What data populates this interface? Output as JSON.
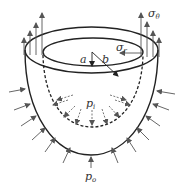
{
  "diagram": {
    "colors": {
      "stroke": "#222222",
      "arrow": "#555555",
      "background": "#ffffff"
    },
    "labels": {
      "a": {
        "text": "a",
        "sub": ""
      },
      "b": {
        "text": "b",
        "sub": ""
      },
      "sigma_r": {
        "text": "σ",
        "sub": "r"
      },
      "sigma_theta": {
        "text": "σ",
        "sub": "θ"
      },
      "p_i": {
        "text": "p",
        "sub": "i"
      },
      "p_o": {
        "text": "p",
        "sub": "o"
      }
    },
    "elements": [
      {
        "name": "outer-rim-ellipse",
        "description": "outer top boundary, radius b"
      },
      {
        "name": "inner-rim-ellipse",
        "description": "inner top boundary, radius a"
      },
      {
        "name": "outer-shell-surface",
        "description": "solid outer hemispherical surface"
      },
      {
        "name": "inner-shell-surface",
        "description": "dashed inner hemispherical surface"
      },
      {
        "name": "hoop-stress-arrows",
        "description": "vertical upward arrows σθ at rim, left and right"
      },
      {
        "name": "external-pressure-arrows",
        "description": "inward-pointing arrows p_o around outer surface"
      },
      {
        "name": "internal-pressure-arrows",
        "description": "dashed outward-pointing arrows p_i on inner surface"
      },
      {
        "name": "radius-a-line",
        "description": "line from center to inner radius"
      },
      {
        "name": "radius-b-line",
        "description": "line from center to outer radius"
      },
      {
        "name": "radial-stress-arrow",
        "description": "horizontal arrow σr near inner rim"
      }
    ]
  }
}
